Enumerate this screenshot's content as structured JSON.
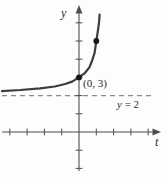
{
  "figure": {
    "background": "#fdfdfd",
    "colors": {
      "axis": "#4d4d4d",
      "curve": "#3d3d3d",
      "dash": "#8a8a8a",
      "dot": "#161616",
      "text": "#2a2a2a"
    },
    "labels": {
      "y_axis": "y",
      "t_axis": "t",
      "point": "(0, 3)",
      "asymptote_var": "y",
      "asymptote_rest": " = 2"
    }
  },
  "chart_data": {
    "type": "line",
    "title": "",
    "xlabel": "t",
    "ylabel": "y",
    "xlim": [
      -4.5,
      4.8
    ],
    "ylim": [
      -2.2,
      7.0
    ],
    "grid": false,
    "x_ticks": [
      -4,
      -3,
      -2,
      -1,
      1,
      2,
      3,
      4
    ],
    "y_ticks": [
      -2,
      -1,
      1,
      2,
      3,
      4,
      5,
      6
    ],
    "asymptote": {
      "y": 2,
      "label": "y = 2"
    },
    "labeled_points": [
      {
        "t": 0,
        "y": 3,
        "label": "(0, 3)"
      }
    ],
    "marked_points": [
      {
        "t": 1,
        "y": 5
      }
    ],
    "curve_points": [
      [
        -4.45,
        2.25
      ],
      [
        -3.4,
        2.31
      ],
      [
        -2.25,
        2.4
      ],
      [
        -1.4,
        2.5
      ],
      [
        -0.8,
        2.64
      ],
      [
        -0.4,
        2.77
      ],
      [
        0.0,
        3.0
      ],
      [
        0.35,
        3.25
      ],
      [
        0.6,
        3.55
      ],
      [
        0.75,
        3.9
      ],
      [
        0.9,
        4.35
      ],
      [
        1.0,
        5.0
      ],
      [
        1.1,
        5.6
      ],
      [
        1.16,
        6.05
      ],
      [
        1.19,
        6.45
      ]
    ]
  }
}
